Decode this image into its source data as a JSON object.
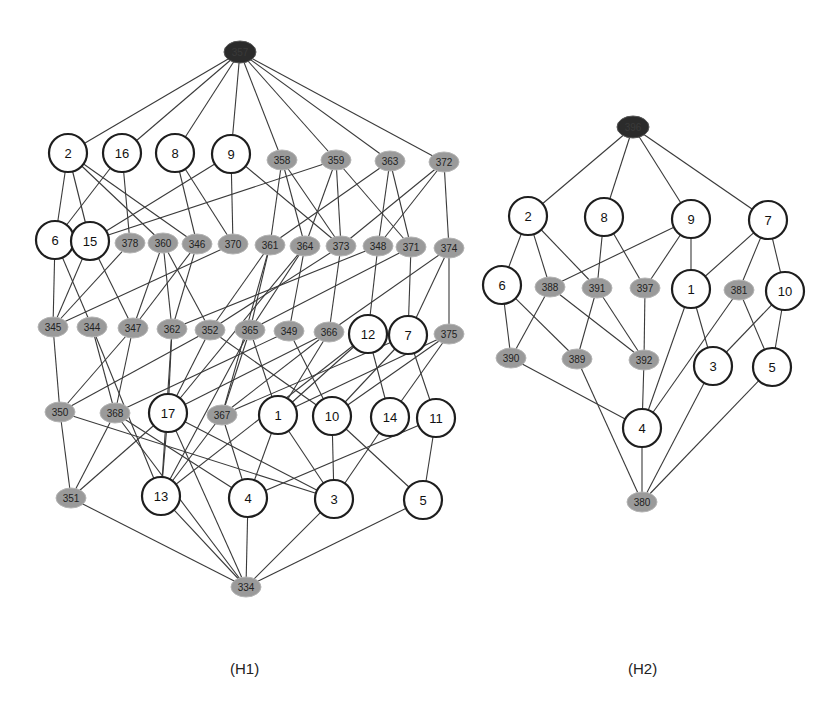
{
  "captions": {
    "h1": "(H1)",
    "h2": "(H2)"
  },
  "colors": {
    "edge": "#3a3a3a",
    "circle_stroke": "#1e1e1e",
    "ellipse_fill": "#9a9a9a",
    "top_fill": "#2b2b2b"
  },
  "graphs": [
    {
      "id": "H1",
      "nodes": [
        {
          "id": "357",
          "label": "357",
          "type": "dark",
          "x": 240,
          "y": 52
        },
        {
          "id": "2",
          "label": "2",
          "type": "circle",
          "x": 68,
          "y": 153
        },
        {
          "id": "16",
          "label": "16",
          "type": "circle",
          "x": 122,
          "y": 153
        },
        {
          "id": "8",
          "label": "8",
          "type": "circle",
          "x": 175,
          "y": 153
        },
        {
          "id": "9",
          "label": "9",
          "type": "circle",
          "x": 231,
          "y": 154
        },
        {
          "id": "358",
          "label": "358",
          "type": "ellipse",
          "x": 282,
          "y": 160
        },
        {
          "id": "359",
          "label": "359",
          "type": "ellipse",
          "x": 336,
          "y": 160
        },
        {
          "id": "363",
          "label": "363",
          "type": "ellipse",
          "x": 390,
          "y": 161
        },
        {
          "id": "372",
          "label": "372",
          "type": "ellipse",
          "x": 444,
          "y": 162
        },
        {
          "id": "6",
          "label": "6",
          "type": "circle",
          "x": 55,
          "y": 240
        },
        {
          "id": "15",
          "label": "15",
          "type": "circle",
          "x": 90,
          "y": 241
        },
        {
          "id": "378",
          "label": "378",
          "type": "ellipse",
          "x": 130,
          "y": 243
        },
        {
          "id": "360",
          "label": "360",
          "type": "ellipse",
          "x": 163,
          "y": 243
        },
        {
          "id": "346",
          "label": "346",
          "type": "ellipse",
          "x": 197,
          "y": 244
        },
        {
          "id": "370",
          "label": "370",
          "type": "ellipse",
          "x": 233,
          "y": 244
        },
        {
          "id": "361",
          "label": "361",
          "type": "ellipse",
          "x": 270,
          "y": 245
        },
        {
          "id": "364",
          "label": "364",
          "type": "ellipse",
          "x": 305,
          "y": 246
        },
        {
          "id": "373",
          "label": "373",
          "type": "ellipse",
          "x": 341,
          "y": 246
        },
        {
          "id": "348",
          "label": "348",
          "type": "ellipse",
          "x": 378,
          "y": 246
        },
        {
          "id": "371",
          "label": "371",
          "type": "ellipse",
          "x": 411,
          "y": 247
        },
        {
          "id": "374",
          "label": "374",
          "type": "ellipse",
          "x": 449,
          "y": 248
        },
        {
          "id": "345",
          "label": "345",
          "type": "ellipse",
          "x": 53,
          "y": 327
        },
        {
          "id": "344",
          "label": "344",
          "type": "ellipse",
          "x": 92,
          "y": 327
        },
        {
          "id": "347",
          "label": "347",
          "type": "ellipse",
          "x": 133,
          "y": 328
        },
        {
          "id": "362",
          "label": "362",
          "type": "ellipse",
          "x": 172,
          "y": 329
        },
        {
          "id": "352",
          "label": "352",
          "type": "ellipse",
          "x": 210,
          "y": 330
        },
        {
          "id": "365",
          "label": "365",
          "type": "ellipse",
          "x": 250,
          "y": 330
        },
        {
          "id": "349",
          "label": "349",
          "type": "ellipse",
          "x": 289,
          "y": 331
        },
        {
          "id": "366",
          "label": "366",
          "type": "ellipse",
          "x": 329,
          "y": 332
        },
        {
          "id": "12",
          "label": "12",
          "type": "circle",
          "x": 368,
          "y": 334
        },
        {
          "id": "7",
          "label": "7",
          "type": "circle",
          "x": 408,
          "y": 335
        },
        {
          "id": "375",
          "label": "375",
          "type": "ellipse",
          "x": 449,
          "y": 334
        },
        {
          "id": "350",
          "label": "350",
          "type": "ellipse",
          "x": 60,
          "y": 412
        },
        {
          "id": "368",
          "label": "368",
          "type": "ellipse",
          "x": 115,
          "y": 413
        },
        {
          "id": "17",
          "label": "17",
          "type": "circle",
          "x": 168,
          "y": 413
        },
        {
          "id": "367",
          "label": "367",
          "type": "ellipse",
          "x": 222,
          "y": 415
        },
        {
          "id": "1",
          "label": "1",
          "type": "circle",
          "x": 278,
          "y": 415
        },
        {
          "id": "10",
          "label": "10",
          "type": "circle",
          "x": 332,
          "y": 416
        },
        {
          "id": "14",
          "label": "14",
          "type": "circle",
          "x": 390,
          "y": 417
        },
        {
          "id": "11",
          "label": "11",
          "type": "circle",
          "x": 436,
          "y": 418
        },
        {
          "id": "351",
          "label": "351",
          "type": "ellipse",
          "x": 71,
          "y": 498
        },
        {
          "id": "13",
          "label": "13",
          "type": "circle",
          "x": 161,
          "y": 496
        },
        {
          "id": "4",
          "label": "4",
          "type": "circle",
          "x": 248,
          "y": 498
        },
        {
          "id": "3",
          "label": "3",
          "type": "circle",
          "x": 334,
          "y": 499
        },
        {
          "id": "5",
          "label": "5",
          "type": "circle",
          "x": 423,
          "y": 500
        },
        {
          "id": "334",
          "label": "334",
          "type": "ellipse",
          "x": 246,
          "y": 587
        }
      ],
      "edges": [
        [
          "357",
          "2"
        ],
        [
          "357",
          "16"
        ],
        [
          "357",
          "8"
        ],
        [
          "357",
          "9"
        ],
        [
          "357",
          "358"
        ],
        [
          "357",
          "359"
        ],
        [
          "357",
          "363"
        ],
        [
          "357",
          "372"
        ],
        [
          "2",
          "6"
        ],
        [
          "2",
          "15"
        ],
        [
          "2",
          "360"
        ],
        [
          "2",
          "346"
        ],
        [
          "16",
          "6"
        ],
        [
          "16",
          "378"
        ],
        [
          "8",
          "346"
        ],
        [
          "8",
          "370"
        ],
        [
          "9",
          "15"
        ],
        [
          "9",
          "370"
        ],
        [
          "9",
          "373"
        ],
        [
          "358",
          "361"
        ],
        [
          "358",
          "364"
        ],
        [
          "358",
          "373"
        ],
        [
          "359",
          "15"
        ],
        [
          "359",
          "364"
        ],
        [
          "359",
          "373"
        ],
        [
          "359",
          "371"
        ],
        [
          "363",
          "348"
        ],
        [
          "363",
          "361"
        ],
        [
          "363",
          "371"
        ],
        [
          "372",
          "374"
        ],
        [
          "372",
          "373"
        ],
        [
          "372",
          "348"
        ],
        [
          "6",
          "345"
        ],
        [
          "6",
          "344"
        ],
        [
          "15",
          "345"
        ],
        [
          "15",
          "347"
        ],
        [
          "378",
          "345"
        ],
        [
          "360",
          "347"
        ],
        [
          "360",
          "362"
        ],
        [
          "360",
          "352"
        ],
        [
          "346",
          "347"
        ],
        [
          "346",
          "362"
        ],
        [
          "370",
          "345"
        ],
        [
          "361",
          "352"
        ],
        [
          "361",
          "365"
        ],
        [
          "361",
          "367"
        ],
        [
          "364",
          "365"
        ],
        [
          "364",
          "349"
        ],
        [
          "364",
          "17"
        ],
        [
          "373",
          "366"
        ],
        [
          "373",
          "352"
        ],
        [
          "348",
          "362"
        ],
        [
          "348",
          "12"
        ],
        [
          "371",
          "7"
        ],
        [
          "371",
          "365"
        ],
        [
          "374",
          "375"
        ],
        [
          "374",
          "7"
        ],
        [
          "374",
          "366"
        ],
        [
          "345",
          "350"
        ],
        [
          "344",
          "13"
        ],
        [
          "344",
          "368"
        ],
        [
          "347",
          "350"
        ],
        [
          "347",
          "368"
        ],
        [
          "362",
          "17"
        ],
        [
          "362",
          "13"
        ],
        [
          "352",
          "350"
        ],
        [
          "352",
          "10"
        ],
        [
          "352",
          "17"
        ],
        [
          "365",
          "367"
        ],
        [
          "365",
          "1"
        ],
        [
          "365",
          "13"
        ],
        [
          "349",
          "10"
        ],
        [
          "349",
          "368"
        ],
        [
          "366",
          "1"
        ],
        [
          "366",
          "17"
        ],
        [
          "366",
          "367"
        ],
        [
          "12",
          "14"
        ],
        [
          "12",
          "1"
        ],
        [
          "12",
          "13"
        ],
        [
          "7",
          "11"
        ],
        [
          "7",
          "10"
        ],
        [
          "7",
          "367"
        ],
        [
          "375",
          "10"
        ],
        [
          "375",
          "1"
        ],
        [
          "375",
          "14"
        ],
        [
          "350",
          "351"
        ],
        [
          "350",
          "3"
        ],
        [
          "368",
          "351"
        ],
        [
          "368",
          "4"
        ],
        [
          "17",
          "351"
        ],
        [
          "17",
          "3"
        ],
        [
          "17",
          "334"
        ],
        [
          "17",
          "13"
        ],
        [
          "367",
          "13"
        ],
        [
          "367",
          "4"
        ],
        [
          "1",
          "4"
        ],
        [
          "1",
          "3"
        ],
        [
          "10",
          "3"
        ],
        [
          "10",
          "5"
        ],
        [
          "14",
          "3"
        ],
        [
          "11",
          "5"
        ],
        [
          "11",
          "4"
        ],
        [
          "351",
          "334"
        ],
        [
          "13",
          "334"
        ],
        [
          "4",
          "334"
        ],
        [
          "3",
          "334"
        ],
        [
          "5",
          "334"
        ],
        [
          "368",
          "334"
        ]
      ]
    },
    {
      "id": "H2",
      "nodes": [
        {
          "id": "396",
          "label": "396",
          "type": "dark",
          "x": 633,
          "y": 127
        },
        {
          "id": "2",
          "label": "2",
          "type": "circle",
          "x": 528,
          "y": 216
        },
        {
          "id": "8",
          "label": "8",
          "type": "circle",
          "x": 604,
          "y": 217
        },
        {
          "id": "9",
          "label": "9",
          "type": "circle",
          "x": 691,
          "y": 219
        },
        {
          "id": "7",
          "label": "7",
          "type": "circle",
          "x": 768,
          "y": 220
        },
        {
          "id": "6",
          "label": "6",
          "type": "circle",
          "x": 502,
          "y": 285
        },
        {
          "id": "388",
          "label": "388",
          "type": "ellipse",
          "x": 550,
          "y": 287
        },
        {
          "id": "391",
          "label": "391",
          "type": "ellipse",
          "x": 597,
          "y": 288
        },
        {
          "id": "397",
          "label": "397",
          "type": "ellipse",
          "x": 645,
          "y": 288
        },
        {
          "id": "1",
          "label": "1",
          "type": "circle",
          "x": 691,
          "y": 289
        },
        {
          "id": "381",
          "label": "381",
          "type": "ellipse",
          "x": 739,
          "y": 290
        },
        {
          "id": "10",
          "label": "10",
          "type": "circle",
          "x": 785,
          "y": 291
        },
        {
          "id": "390",
          "label": "390",
          "type": "ellipse",
          "x": 511,
          "y": 358
        },
        {
          "id": "389",
          "label": "389",
          "type": "ellipse",
          "x": 577,
          "y": 359
        },
        {
          "id": "392",
          "label": "392",
          "type": "ellipse",
          "x": 644,
          "y": 360
        },
        {
          "id": "3",
          "label": "3",
          "type": "circle",
          "x": 713,
          "y": 366
        },
        {
          "id": "5",
          "label": "5",
          "type": "circle",
          "x": 772,
          "y": 367
        },
        {
          "id": "4",
          "label": "4",
          "type": "circle",
          "x": 642,
          "y": 428
        },
        {
          "id": "380",
          "label": "380",
          "type": "ellipse",
          "x": 642,
          "y": 502
        }
      ],
      "edges": [
        [
          "396",
          "2"
        ],
        [
          "396",
          "8"
        ],
        [
          "396",
          "9"
        ],
        [
          "396",
          "7"
        ],
        [
          "2",
          "6"
        ],
        [
          "2",
          "388"
        ],
        [
          "2",
          "391"
        ],
        [
          "8",
          "391"
        ],
        [
          "8",
          "397"
        ],
        [
          "9",
          "388"
        ],
        [
          "9",
          "397"
        ],
        [
          "9",
          "1"
        ],
        [
          "7",
          "1"
        ],
        [
          "7",
          "381"
        ],
        [
          "7",
          "10"
        ],
        [
          "6",
          "390"
        ],
        [
          "6",
          "389"
        ],
        [
          "388",
          "390"
        ],
        [
          "388",
          "392"
        ],
        [
          "391",
          "389"
        ],
        [
          "391",
          "392"
        ],
        [
          "397",
          "392"
        ],
        [
          "1",
          "4"
        ],
        [
          "1",
          "3"
        ],
        [
          "381",
          "4"
        ],
        [
          "381",
          "5"
        ],
        [
          "10",
          "3"
        ],
        [
          "10",
          "5"
        ],
        [
          "390",
          "4"
        ],
        [
          "392",
          "4"
        ],
        [
          "389",
          "380"
        ],
        [
          "4",
          "380"
        ],
        [
          "3",
          "380"
        ],
        [
          "5",
          "380"
        ]
      ]
    }
  ]
}
